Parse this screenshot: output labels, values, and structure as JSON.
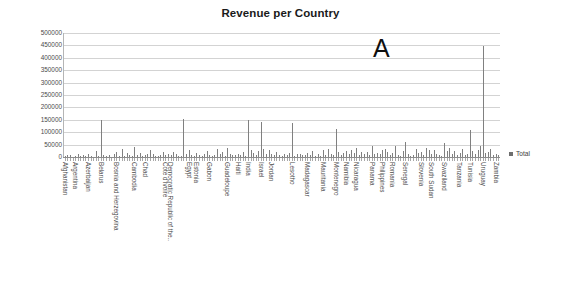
{
  "chart_data": {
    "type": "bar",
    "title": "Revenue per Country",
    "xlabel": "",
    "ylabel": "",
    "ylim": [
      0,
      500000
    ],
    "ytick_step": 50000,
    "yticks": [
      "500000",
      "450000",
      "400000",
      "350000",
      "300000",
      "250000",
      "200000",
      "150000",
      "100000",
      "50000",
      "0"
    ],
    "grid": true,
    "legend_position": "right",
    "legend": [
      "Total"
    ],
    "annotations": [
      {
        "text": "A",
        "x_frac": 0.71,
        "y_value": 440000
      }
    ],
    "bar_color": "#808080",
    "categories": [
      "Afghanistan",
      "Albania",
      "Algeria",
      "Angola",
      "Argentina",
      "Armenia",
      "Aruba",
      "Australia",
      "Austria",
      "Azerbaijan",
      "Bahamas",
      "Bahrain",
      "Bangladesh",
      "Barbados",
      "Belarus",
      "Belgium",
      "Belize",
      "Benin",
      "Bhutan",
      "Bolivia",
      "Bosnia and Herzegovina",
      "Botswana",
      "Brazil",
      "Brunei",
      "Bulgaria",
      "Burkina Faso",
      "Burundi",
      "Cambodia",
      "Cameroon",
      "Canada",
      "Cape Verde",
      "Chad",
      "Chile",
      "China",
      "Colombia",
      "Comoros",
      "Congo",
      "Costa Rica",
      "Croatia",
      "Cote d'Ivoire",
      "Cuba",
      "Cyprus",
      "Czech Republic",
      "Denmark",
      "Djibouti",
      "Dominica",
      "Democratic Republic of the Congo",
      "Ecuador",
      "Egypt",
      "El Salvador",
      "Eritrea",
      "Estonia",
      "Ethiopia",
      "Fiji",
      "Finland",
      "France",
      "Gabon",
      "Gambia",
      "Georgia",
      "Germany",
      "Ghana",
      "Greece",
      "Grenada",
      "Guadeloupe",
      "Guatemala",
      "Guinea",
      "Guyana",
      "Haiti",
      "Honduras",
      "Hungary",
      "Iceland",
      "India",
      "Indonesia",
      "Iran",
      "Iraq",
      "Ireland",
      "Israel",
      "Italy",
      "Jamaica",
      "Japan",
      "Jordan",
      "Kazakhstan",
      "Kenya",
      "Kuwait",
      "Kyrgyzstan",
      "Laos",
      "Latvia",
      "Lebanon",
      "Lesotho",
      "Liberia",
      "Libya",
      "Lithuania",
      "Luxembourg",
      "Macedonia",
      "Madagascar",
      "Malawi",
      "Malaysia",
      "Maldives",
      "Mali",
      "Malta",
      "Mauritania",
      "Mauritius",
      "Mexico",
      "Moldova",
      "Mongolia",
      "Montenegro",
      "Morocco",
      "Mozambique",
      "Myanmar",
      "Namibia",
      "Nepal",
      "Netherlands",
      "New Zealand",
      "Nicaragua",
      "Niger",
      "Nigeria",
      "Norway",
      "Oman",
      "Pakistan",
      "Panama",
      "Papua New Guinea",
      "Paraguay",
      "Peru",
      "Philippines",
      "Poland",
      "Portugal",
      "Qatar",
      "Romania",
      "Russia",
      "Rwanda",
      "Samoa",
      "Saudi Arabia",
      "Senegal",
      "Serbia",
      "Seychelles",
      "Sierra Leone",
      "Singapore",
      "Slovakia",
      "Slovenia",
      "Somalia",
      "South Africa",
      "South Korea",
      "South Sudan",
      "Spain",
      "Sri Lanka",
      "Sudan",
      "Suriname",
      "Swaziland",
      "Sweden",
      "Switzerland",
      "Syria",
      "Taiwan",
      "Tajikistan",
      "Tanzania",
      "Thailand",
      "Togo",
      "Trinidad",
      "Tunisia",
      "Turkey",
      "Uganda",
      "Ukraine",
      "United Kingdom",
      "Uruguay",
      "Uzbekistan",
      "Venezuela",
      "Vietnam",
      "Yemen",
      "Zambia",
      "Zimbabwe"
    ],
    "visible_tick_labels": [
      "Afghanistan",
      "Argentina",
      "Azerbaijan",
      "Belarus",
      "Bosnia and Herzegovina",
      "Cambodia",
      "Chad",
      "Cote d'Ivoire",
      "Democratic Republic of the..",
      "Egypt",
      "Estonia",
      "Gabon",
      "Guadeloupe",
      "Haiti",
      "India",
      "Israel",
      "Jordan",
      "Lesotho",
      "Madagascar",
      "Mauritania",
      "Montenegro",
      "Namibia",
      "Nicaragua",
      "Panama",
      "Philippines",
      "Romania",
      "Senegal",
      "Slovenia",
      "South Sudan",
      "Swaziland",
      "Tanzania",
      "Tunisia",
      "Uruguay",
      "Zambia"
    ],
    "series": [
      {
        "name": "Total",
        "values": [
          3000,
          9000,
          7000,
          2000,
          4000,
          12000,
          3000,
          8000,
          5000,
          11000,
          4000,
          2000,
          26000,
          6000,
          148000,
          9000,
          3000,
          7000,
          2000,
          14000,
          22000,
          5000,
          31000,
          4000,
          18000,
          7000,
          3000,
          42000,
          9000,
          16000,
          4000,
          8000,
          13000,
          27000,
          11000,
          3000,
          6000,
          9000,
          21000,
          8000,
          12000,
          7000,
          19000,
          14000,
          3000,
          5000,
          152000,
          11000,
          28000,
          9000,
          4000,
          17000,
          8000,
          3000,
          13000,
          25000,
          7000,
          4000,
          9000,
          31000,
          11000,
          19000,
          5000,
          38000,
          14000,
          7000,
          9000,
          12000,
          8000,
          22000,
          6000,
          151000,
          27000,
          17000,
          9000,
          24000,
          141000,
          33000,
          11000,
          29000,
          13000,
          8000,
          19000,
          7000,
          4000,
          12000,
          9000,
          16000,
          136000,
          5000,
          11000,
          14000,
          7000,
          9000,
          18000,
          8000,
          23000,
          4000,
          11000,
          6000,
          27000,
          9000,
          34000,
          13000,
          7000,
          112000,
          21000,
          9000,
          15000,
          26000,
          11000,
          29000,
          18000,
          37000,
          8000,
          22000,
          14000,
          19000,
          9000,
          43000,
          12000,
          16000,
          11000,
          27000,
          33000,
          21000,
          9000,
          18000,
          46000,
          7000,
          3000,
          24000,
          62000,
          13000,
          4000,
          8000,
          31000,
          16000,
          21000,
          9000,
          38000,
          27000,
          11000,
          29000,
          14000,
          9000,
          5000,
          57000,
          23000,
          36000,
          12000,
          26000,
          7000,
          18000,
          31000,
          9000,
          11000,
          108000,
          24000,
          13000,
          27000,
          44000,
          449000,
          16000,
          21000,
          33000,
          9000,
          12000,
          7000
        ]
      }
    ]
  }
}
